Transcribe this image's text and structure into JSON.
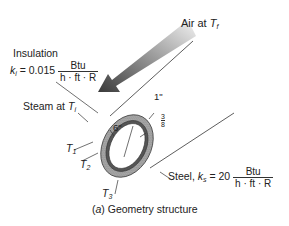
{
  "figure": {
    "caption": "(a) Geometry structure",
    "caption_prefix": "(",
    "caption_letter": "a",
    "caption_rest": ") Geometry structure"
  },
  "labels": {
    "air": {
      "text": "Air at ",
      "var": "T",
      "sub": "f"
    },
    "insulation": {
      "title": "Insulation",
      "k_var": "k",
      "k_sub": "i",
      "k_value": " = 0.015",
      "unit_num": "Btu",
      "unit_den": "h · ft · R"
    },
    "steam": {
      "text": "Steam at ",
      "var": "T",
      "sub": "i"
    },
    "steel": {
      "text": "Steel, ",
      "k_var": "k",
      "k_sub": "s",
      "k_value": " = 20",
      "unit_num": "Btu",
      "unit_den": "h · ft · R"
    },
    "dim_insulation": "1\"",
    "dim_diameter": "6\"",
    "dim_steel_num": "3",
    "dim_steel_den": "8",
    "dim_steel_unit": "\"",
    "T1": {
      "var": "T",
      "sub": "1"
    },
    "T2": {
      "var": "T",
      "sub": "2"
    },
    "T3": {
      "var": "T",
      "sub": "3"
    }
  },
  "colors": {
    "insulation": "#a8a8a8",
    "steel": "#555555",
    "arrow_dark": "#444444",
    "arrow_light": "#e8e8e8",
    "line": "#333333"
  }
}
